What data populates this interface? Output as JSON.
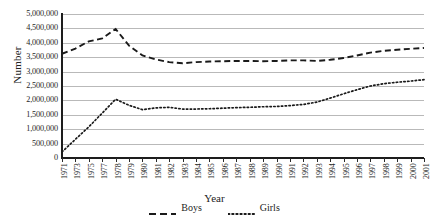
{
  "chart_data": {
    "type": "line",
    "title": "",
    "xlabel": "Year",
    "ylabel": "Number",
    "ylim": [
      0,
      5000000
    ],
    "ytick_step": 500000,
    "grid": true,
    "legend_position": "bottom",
    "x": [
      1971,
      1973,
      1975,
      1977,
      1978,
      1979,
      1980,
      1981,
      1982,
      1983,
      1984,
      1985,
      1986,
      1987,
      1988,
      1989,
      1990,
      1991,
      1992,
      1993,
      1994,
      1995,
      1996,
      1997,
      1998,
      1999,
      2000,
      2001
    ],
    "categories": [
      "1971",
      "1973",
      "1975",
      "1977",
      "1978",
      "1979",
      "1980",
      "1981",
      "1982",
      "1983",
      "1984",
      "1985",
      "1986",
      "1987",
      "1988",
      "1989",
      "1990",
      "1991",
      "1992",
      "1993",
      "1994",
      "1995",
      "1996",
      "1997",
      "1998",
      "1999",
      "2000",
      "2001"
    ],
    "ytick_labels": [
      "5,000,000",
      "4,500,000",
      "4,000,000",
      "3,500,000",
      "3,000,000",
      "2,500,000",
      "2,000,000",
      "1,500,000",
      "1,000,000",
      "500,000",
      "0"
    ],
    "ytick_values": [
      5000000,
      4500000,
      4000000,
      3500000,
      3000000,
      2500000,
      2000000,
      1500000,
      1000000,
      500000,
      0
    ],
    "series": [
      {
        "name": "Boys",
        "style": "dashed",
        "color": "#1a1a1a",
        "values": [
          3620000,
          3800000,
          4050000,
          4150000,
          4480000,
          3900000,
          3560000,
          3420000,
          3330000,
          3290000,
          3330000,
          3350000,
          3360000,
          3370000,
          3370000,
          3360000,
          3370000,
          3390000,
          3390000,
          3370000,
          3410000,
          3470000,
          3560000,
          3660000,
          3720000,
          3760000,
          3790000,
          3820000
        ]
      },
      {
        "name": "Girls",
        "style": "dotted",
        "color": "#1a1a1a",
        "values": [
          210000,
          650000,
          1080000,
          1560000,
          2040000,
          1830000,
          1680000,
          1740000,
          1760000,
          1700000,
          1700000,
          1710000,
          1730000,
          1750000,
          1760000,
          1780000,
          1790000,
          1820000,
          1860000,
          1940000,
          2080000,
          2230000,
          2370000,
          2500000,
          2580000,
          2630000,
          2670000,
          2720000
        ]
      }
    ]
  },
  "legend": {
    "items": [
      {
        "label": "Boys",
        "style": "dashed"
      },
      {
        "label": "Girls",
        "style": "dotted"
      }
    ]
  },
  "axes": {
    "y_title": "Number",
    "x_title": "Year"
  }
}
